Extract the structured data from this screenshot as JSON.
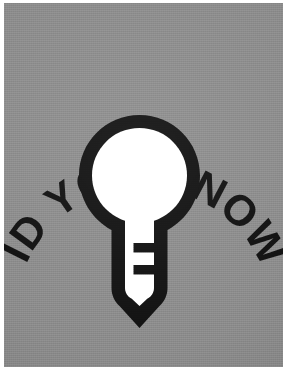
{
  "poster": {
    "headline": "DID YOU KNOW?",
    "headline_words": [
      "DID",
      "YOU",
      "KNOW?"
    ],
    "icon_name": "lightbulb-icon",
    "background_color": "#8b8b8b",
    "ink_color": "#111111",
    "bulb_glass_color": "#ffffff",
    "paper_edge_color": "#ffffff",
    "layout": {
      "text_style": "arc",
      "text_arc_direction": "clockwise-over-top",
      "icon_position": "center"
    }
  }
}
